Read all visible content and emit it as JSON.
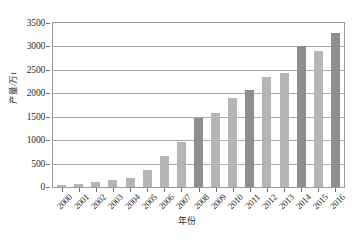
{
  "chart_data": {
    "type": "bar",
    "title": "",
    "xlabel": "年份",
    "ylabel": "产量/万t",
    "categories": [
      "2000",
      "2001",
      "2002",
      "2003",
      "2004",
      "2005",
      "2006",
      "2007",
      "2008",
      "2009",
      "2010",
      "2011",
      "2012",
      "2013",
      "2014",
      "2015",
      "2016"
    ],
    "values": [
      50,
      60,
      110,
      160,
      200,
      370,
      670,
      970,
      1480,
      1580,
      1910,
      2070,
      2350,
      2440,
      3000,
      2900,
      3280
    ],
    "bar_shades": [
      "light",
      "light",
      "light",
      "light",
      "light",
      "light",
      "light",
      "light",
      "dark",
      "light",
      "light",
      "dark",
      "light",
      "light",
      "dark",
      "light",
      "dark"
    ],
    "ylim": [
      0,
      3500
    ],
    "ytick_labels": [
      "0",
      "500",
      "1000",
      "1500",
      "2000",
      "2500",
      "3000",
      "3500"
    ],
    "ytick_values": [
      0,
      500,
      1000,
      1500,
      2000,
      2500,
      3000,
      3500
    ],
    "grid": true,
    "legend": "none",
    "colors": {
      "bar_light": "#b5b5b5",
      "bar_dark": "#8e8e8e",
      "gridline": "#a8a8a8",
      "frame": "#9a9a9a",
      "text": "#2b2b2b",
      "background": "#ffffff"
    }
  }
}
